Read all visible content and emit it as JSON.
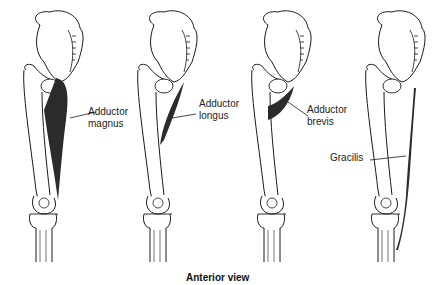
{
  "figure": {
    "caption": "Anterior view",
    "panels": [
      {
        "id": "adductor-magnus",
        "label_line1": "Adductor",
        "label_line2": "magnus"
      },
      {
        "id": "adductor-longus",
        "label_line1": "Adductor",
        "label_line2": "longus"
      },
      {
        "id": "adductor-brevis",
        "label_line1": "Adductor",
        "label_line2": "brevis"
      },
      {
        "id": "gracilis",
        "label_line1": "Gracilis"
      }
    ],
    "colors": {
      "line": "#1a1a1a",
      "muscle": "#2b2b2b",
      "background": "#ffffff"
    }
  }
}
